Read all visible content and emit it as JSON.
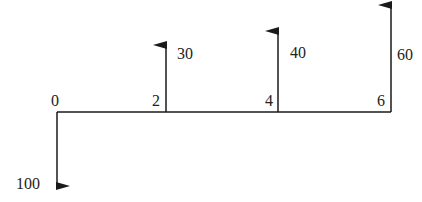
{
  "diagram": {
    "type": "cash-flow-diagram",
    "colors": {
      "line": "#1a1a1a",
      "text": "#222222",
      "background": "#ffffff"
    },
    "time_labels": [
      "0",
      "2",
      "4",
      "6"
    ],
    "flows": [
      {
        "period": "0",
        "amount": "100",
        "direction": "down"
      },
      {
        "period": "2",
        "amount": "30",
        "direction": "up"
      },
      {
        "period": "4",
        "amount": "40",
        "direction": "up"
      },
      {
        "period": "6",
        "amount": "60",
        "direction": "up"
      }
    ]
  }
}
